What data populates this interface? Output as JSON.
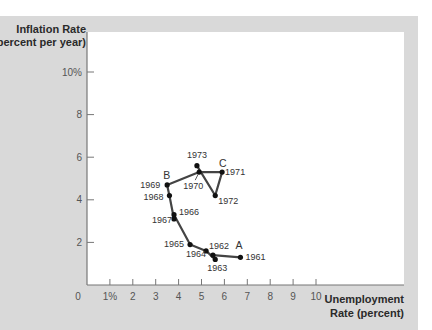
{
  "chart_data": {
    "type": "line",
    "title": "",
    "xlabel": "Unemployment Rate (percent)",
    "xlabel_lines": [
      "Unemployment",
      "Rate (percent)"
    ],
    "ylabel": "Inflation Rate (percent per year)",
    "ylabel_lines": [
      "Inflation Rate",
      "(percent per year)"
    ],
    "xlim": [
      0,
      10
    ],
    "ylim": [
      0,
      10
    ],
    "grid": false,
    "x_ticks": [
      {
        "value": 0,
        "label": "0"
      },
      {
        "value": 1,
        "label": "1%"
      },
      {
        "value": 2,
        "label": "2"
      },
      {
        "value": 3,
        "label": "3"
      },
      {
        "value": 4,
        "label": "4"
      },
      {
        "value": 5,
        "label": "5"
      },
      {
        "value": 6,
        "label": "6"
      },
      {
        "value": 7,
        "label": "7"
      },
      {
        "value": 8,
        "label": "8"
      },
      {
        "value": 9,
        "label": "9"
      },
      {
        "value": 10,
        "label": "10"
      }
    ],
    "y_ticks": [
      {
        "value": 2,
        "label": "2"
      },
      {
        "value": 4,
        "label": "4"
      },
      {
        "value": 6,
        "label": "6"
      },
      {
        "value": 8,
        "label": "8"
      },
      {
        "value": 10,
        "label": "10%"
      }
    ],
    "series": [
      {
        "name": "Inflation vs. Unemployment, 1961–1973",
        "points": [
          {
            "year": "1961",
            "x": 6.7,
            "y": 1.3
          },
          {
            "year": "1962",
            "x": 5.5,
            "y": 1.4
          },
          {
            "year": "1963",
            "x": 5.6,
            "y": 1.2
          },
          {
            "year": "1964",
            "x": 5.2,
            "y": 1.6
          },
          {
            "year": "1965",
            "x": 4.5,
            "y": 1.9
          },
          {
            "year": "1966",
            "x": 3.8,
            "y": 3.3
          },
          {
            "year": "1967",
            "x": 3.8,
            "y": 3.1
          },
          {
            "year": "1968",
            "x": 3.6,
            "y": 4.2
          },
          {
            "year": "1969",
            "x": 3.5,
            "y": 4.7
          },
          {
            "year": "1970",
            "x": 4.9,
            "y": 5.3
          },
          {
            "year": "1971",
            "x": 5.9,
            "y": 5.3
          },
          {
            "year": "1972",
            "x": 5.6,
            "y": 4.2
          },
          {
            "year": "1973",
            "x": 4.8,
            "y": 5.6
          }
        ]
      }
    ],
    "annotations": [
      {
        "text": "A",
        "near": "1961"
      },
      {
        "text": "B",
        "near": "1969"
      },
      {
        "text": "C",
        "near": "1971"
      }
    ],
    "colors": {
      "line": "#444444",
      "point": "#111111",
      "panel": "#d9d9d9",
      "plot": "#ffffff"
    }
  }
}
